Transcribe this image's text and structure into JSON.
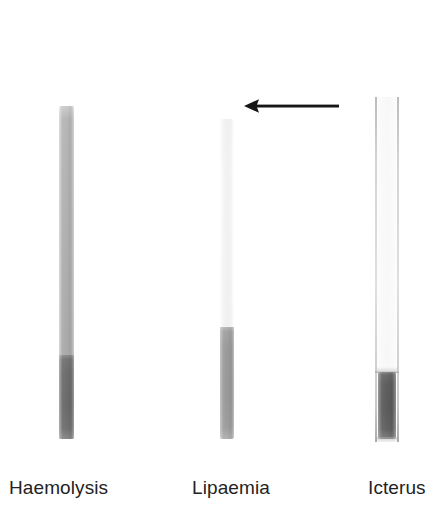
{
  "figure": {
    "type": "specimen-interference-photograph",
    "background_color": "#ffffff",
    "width_px": 446,
    "height_px": 521
  },
  "specimens": [
    {
      "id": "haemolysis",
      "caption": "Haemolysis",
      "serum_layer_color": "#b0b0b0",
      "cell_layer_color": "#6e6e6e",
      "tube_left_px": 59,
      "tube_top_px": 106,
      "tube_width_px": 15,
      "tube_height_px": 333,
      "interface_from_top_px": 249
    },
    {
      "id": "lipaemia",
      "caption": "Lipaemia",
      "serum_layer_color": "#f4f4f4",
      "cell_layer_color": "#9a9a9a",
      "tube_left_px": 220,
      "tube_top_px": 119,
      "tube_width_px": 14,
      "tube_height_px": 320,
      "interface_from_top_px": 208
    },
    {
      "id": "icterus",
      "caption": "Icterus",
      "serum_layer_color": "#fbfbfb",
      "cell_layer_color": "#5f5f5f",
      "tube_left_px": 375,
      "tube_top_px": 97,
      "tube_width_px": 24,
      "tube_height_px": 345,
      "interface_from_top_px": 275
    }
  ],
  "annotation": {
    "arrow": {
      "name": "left-pointing-arrow",
      "direction": "left",
      "color": "#161616",
      "tail_x_px": 337,
      "head_x_px": 243,
      "y_px": 106,
      "points_at": "lipaemia"
    }
  },
  "captions": {
    "haemolysis": "Haemolysis",
    "lipaemia": "Lipaemia",
    "icterus": "Icterus"
  },
  "colors": {
    "text": "#232323",
    "arrow": "#161616",
    "background": "#ffffff"
  }
}
